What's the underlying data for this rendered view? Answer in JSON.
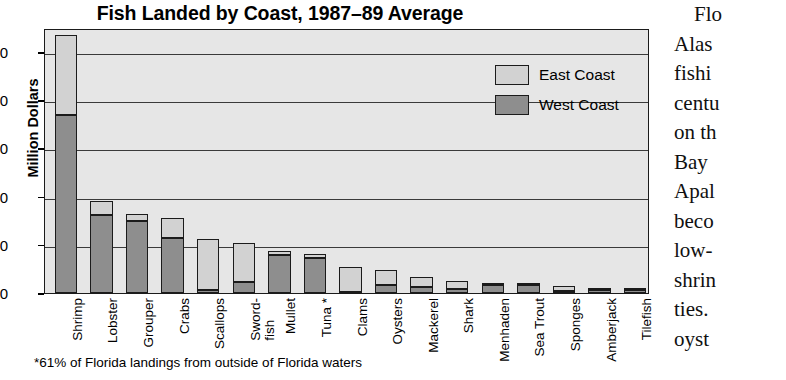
{
  "chart_data": {
    "type": "bar",
    "subtype": "stacked-vertical",
    "title": "Fish Landed by Coast, 1987–89 Average",
    "xlabel": "",
    "ylabel": "Million Dollars",
    "ylim": [
      0,
      55
    ],
    "yticks": [
      0,
      10,
      20,
      30,
      40,
      50
    ],
    "ytick_labels": [
      "0",
      "10",
      "20",
      "30",
      "40",
      "50"
    ],
    "grid": "horizontal",
    "legend_position": "upper-right",
    "categories": [
      "Shrimp",
      "Lobster",
      "Grouper",
      "Crabs",
      "Scallops",
      "Sword-\nfish",
      "Mullet",
      "Tuna *",
      "Clams",
      "Oysters",
      "Mackerel",
      "Shark",
      "Menhaden",
      "Sea Trout",
      "Sponges",
      "Amberjack",
      "Tilefish"
    ],
    "series": [
      {
        "name": "West Coast",
        "color": "#8e8e8e",
        "values": [
          37.0,
          16.2,
          15.0,
          11.4,
          0.7,
          2.3,
          7.9,
          7.3,
          0.3,
          1.6,
          1.3,
          0.9,
          1.7,
          1.6,
          0.4,
          0.7,
          0.7
        ]
      },
      {
        "name": "East Coast",
        "color": "#d2d2d2",
        "values": [
          16.5,
          2.8,
          1.5,
          4.1,
          10.6,
          8.0,
          0.8,
          0.7,
          5.2,
          3.2,
          2.0,
          1.6,
          0.2,
          0.1,
          1.0,
          0.1,
          0.1
        ]
      }
    ],
    "totals": [
      53.5,
      19.0,
      16.5,
      15.5,
      11.3,
      10.3,
      8.7,
      8.0,
      5.5,
      4.8,
      3.3,
      2.5,
      1.9,
      1.7,
      1.4,
      0.8,
      0.8
    ],
    "footnote": "*61% of Florida landings from outside of Florida waters"
  },
  "legend": {
    "items": [
      {
        "label": "East Coast",
        "color": "#d2d2d2"
      },
      {
        "label": "West Coast",
        "color": "#8e8e8e"
      }
    ]
  },
  "body_text": {
    "lines": [
      "Flo",
      "Alas",
      "fishi",
      "centu",
      "on th",
      "Bay",
      "Apal",
      "beco",
      "low-",
      "shrin",
      "ties.",
      "oyst"
    ]
  }
}
